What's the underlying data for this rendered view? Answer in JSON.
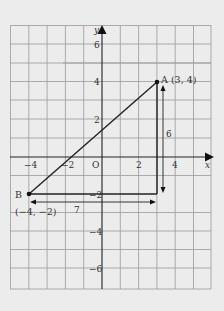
{
  "diagram": {
    "axes": {
      "x_label": "x",
      "y_label": "y",
      "origin_label": "O",
      "x_ticks": [
        "−4",
        "−2",
        "2",
        "4"
      ],
      "y_ticks": [
        "6",
        "4",
        "2",
        "−2",
        "−4",
        "−6"
      ]
    },
    "points": {
      "A": {
        "label": "A (3, 4)",
        "x": 3,
        "y": 4
      },
      "B": {
        "label": "B",
        "coords": "(−4, −2)",
        "x": -4,
        "y": -2
      }
    },
    "measures": {
      "horizontal": "7",
      "vertical": "6"
    },
    "colors": {
      "background": "#ececec",
      "grid": "#9a9a9a",
      "line": "#222222"
    }
  }
}
